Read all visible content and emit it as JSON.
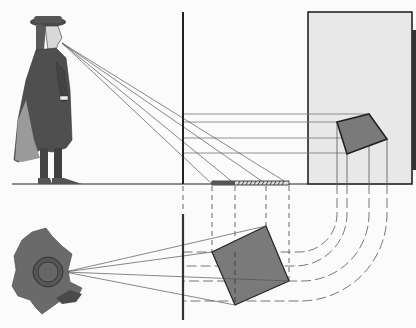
{
  "diagram": {
    "title": "Perspective projection: viewer, picture plane, and projected square (elevation and plan)",
    "colors": {
      "background": "#fbfbfb",
      "ink": "#222222",
      "ray": "#555555",
      "picture_panel": "#e8e8e8",
      "square_fill": "#7a7a7a",
      "figure_dark": "#4a4a4a",
      "figure_mid": "#6a6a6a",
      "figure_light": "#9a9a9a"
    },
    "elevation": {
      "viewer": "standing-man-profile",
      "eye": [
        62,
        43
      ],
      "picture_plane_x": 183,
      "ground_y": 184,
      "picture_panel": {
        "x": 308,
        "y": 12,
        "w": 104,
        "h": 172
      },
      "projected_square": [
        [
          337,
          122
        ],
        [
          369,
          114
        ],
        [
          387,
          139
        ],
        [
          347,
          154
        ]
      ],
      "hatched_bar": {
        "x1": 212,
        "x2": 289,
        "y": 184
      },
      "ray_targets_y": [
        114,
        122,
        138,
        153
      ]
    },
    "plan": {
      "viewer": "man-top-view",
      "eye": [
        65,
        272
      ],
      "picture_plane": {
        "x": 183,
        "y1": 214,
        "y2": 320
      },
      "square": [
        [
          212,
          252
        ],
        [
          266,
          226
        ],
        [
          289,
          281
        ],
        [
          235,
          305
        ]
      ],
      "dashed_verticals_x": [
        212,
        235,
        266,
        289
      ],
      "curve_columns_x": [
        337,
        347,
        369,
        387
      ]
    }
  }
}
